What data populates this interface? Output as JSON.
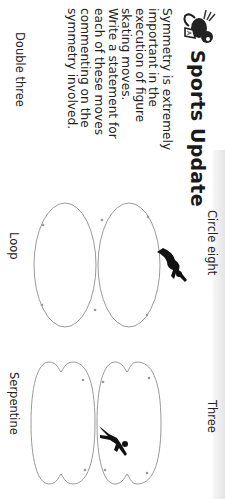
{
  "header": {
    "logo_icon": "bee-mascot-icon",
    "title": "Sports Update"
  },
  "intro": {
    "paragraphs": [
      "Symmetry is extremely important in the execution of figure skating moves.",
      "Write a statement for each of these moves commenting on the symmetry involved."
    ]
  },
  "moves": [
    {
      "label": "Double three",
      "position": "left-bottom"
    },
    {
      "label": "Circle eight",
      "position": "center-top",
      "icon": "skater-silhouette-icon"
    },
    {
      "label": "Loop",
      "position": "center-bottom"
    },
    {
      "label": "Three",
      "position": "right-top",
      "icon": "skater-silhouette-icon"
    },
    {
      "label": "Serpentine",
      "position": "right-bottom"
    }
  ],
  "colors": {
    "text": "#1a1a1a",
    "diagram_line": "#9a9a9a",
    "skater": "#111111"
  }
}
